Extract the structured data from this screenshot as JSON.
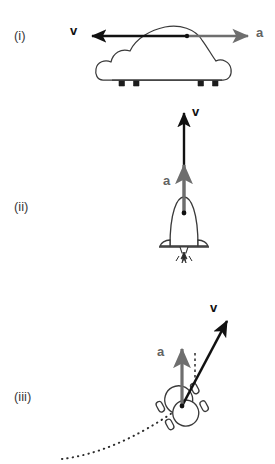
{
  "figure": {
    "background_color": "#ffffff",
    "velocity_color": "#111111",
    "acceleration_color": "#6e6e6e",
    "outline_color": "#3a3a3a",
    "path_color": "#2b2b2b"
  },
  "panels": [
    {
      "id": "i",
      "label": "(i)",
      "object": "car-side-view",
      "description": "Car moving left while accelerating right (slowing down)",
      "vectors": [
        {
          "name": "v",
          "label": "v",
          "type": "velocity",
          "color": "#111111",
          "direction": "left",
          "start": [
            187,
            36
          ],
          "end": [
            88,
            36
          ]
        },
        {
          "name": "a",
          "label": "a",
          "type": "acceleration",
          "color": "#6e6e6e",
          "direction": "right",
          "start": [
            187,
            36
          ],
          "end": [
            252,
            36
          ]
        }
      ]
    },
    {
      "id": "ii",
      "label": "(ii)",
      "object": "rocket",
      "description": "Rocket launching upward, velocity and acceleration both up",
      "vectors": [
        {
          "name": "v",
          "label": "v",
          "type": "velocity",
          "color": "#111111",
          "direction": "up",
          "start": [
            184,
            213
          ],
          "end": [
            184,
            109
          ]
        },
        {
          "name": "a",
          "label": "a",
          "type": "acceleration",
          "color": "#6e6e6e",
          "direction": "up",
          "start": [
            184,
            213
          ],
          "end": [
            184,
            161
          ]
        }
      ]
    },
    {
      "id": "iii",
      "label": "(iii)",
      "object": "car-top-view",
      "description": "Car turning along a curved dotted path; velocity tangent, acceleration toward inside of curve",
      "vectors": [
        {
          "name": "v",
          "label": "v",
          "type": "velocity",
          "color": "#111111",
          "direction": "up-right",
          "start": [
            182,
            406
          ],
          "end": [
            230,
            316
          ]
        },
        {
          "name": "a",
          "label": "a",
          "type": "acceleration",
          "color": "#6e6e6e",
          "direction": "up",
          "start": [
            182,
            406
          ],
          "end": [
            182,
            345
          ]
        }
      ],
      "path": {
        "name": "trajectory",
        "style": "dotted",
        "from": [
          62,
          459
        ],
        "to": [
          182,
          406
        ]
      }
    }
  ]
}
